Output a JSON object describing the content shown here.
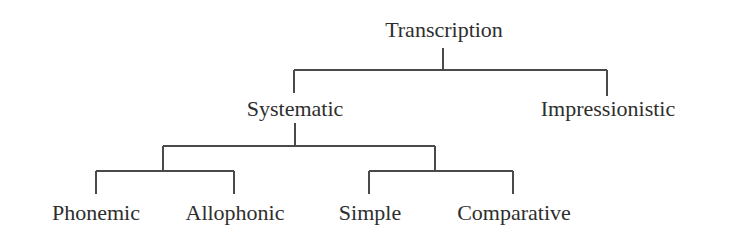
{
  "diagram": {
    "type": "tree",
    "title": "Transcription",
    "colors": {
      "text": "#2e2e2e",
      "line": "#4a4a4a",
      "background": "#ffffff"
    },
    "root": {
      "label": "Transcription",
      "children": [
        {
          "label": "Systematic",
          "children": [
            {
              "label": "",
              "children": [
                {
                  "label": "Phonemic"
                },
                {
                  "label": "Allophonic"
                }
              ]
            },
            {
              "label": "",
              "children": [
                {
                  "label": "Simple"
                },
                {
                  "label": "Comparative"
                }
              ]
            }
          ]
        },
        {
          "label": "Impressionistic"
        }
      ]
    }
  },
  "labels": {
    "transcription": "Transcription",
    "systematic": "Systematic",
    "impressionistic": "Impressionistic",
    "phonemic": "Phonemic",
    "allophonic": "Allophonic",
    "simple": "Simple",
    "comparative": "Comparative"
  }
}
